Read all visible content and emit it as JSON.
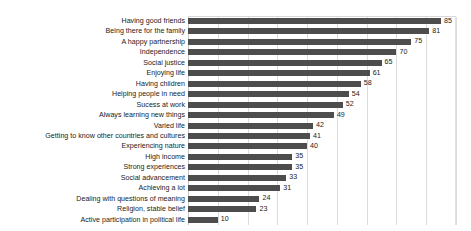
{
  "chart_data": {
    "type": "bar",
    "orientation": "horizontal",
    "title": "",
    "subtitle": "",
    "xlabel": "",
    "ylabel": "",
    "xlim": [
      0,
      90
    ],
    "grid": true,
    "grid_axis": "x",
    "gridline_values": [
      0,
      10,
      20,
      30,
      40,
      50,
      60,
      70,
      80,
      90
    ],
    "tick_labels_visible": false,
    "legend": false,
    "legend_position": "none",
    "data_labels": true,
    "bar_color": "#4d4d4d",
    "grid_color": "#dcdcdc",
    "background_color": "#ffffff",
    "categories": [
      "Having good friends",
      "Being there for the family",
      "A happy partnership",
      "Independence",
      "Social justice",
      "Enjoying life",
      "Having children",
      "Helping people in need",
      "Sucess at work",
      "Always learning new things",
      "Varied life",
      "Getting to know other countries and cultures",
      "Experiencing nature",
      "High income",
      "Strong experiences",
      "Social advancement",
      "Achieving a lot",
      "Dealing with questions of meaning",
      "Religion, stable belief",
      "Active participation in political life"
    ],
    "values": [
      85,
      81,
      75,
      70,
      65,
      61,
      58,
      54,
      52,
      49,
      42,
      41,
      40,
      35,
      35,
      33,
      31,
      24,
      23,
      10
    ],
    "value_labels": [
      "85",
      "81",
      "75",
      "70",
      "65",
      "61",
      "58",
      "54",
      "52",
      "49",
      "42",
      "41",
      "40",
      "35",
      "35",
      "33",
      "31",
      "24",
      "23",
      "10"
    ]
  }
}
